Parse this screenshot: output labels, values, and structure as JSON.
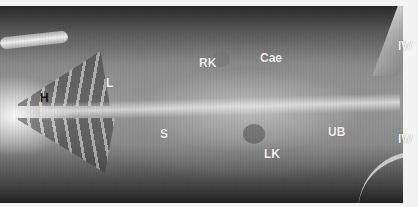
{
  "image": {
    "type": "radiograph",
    "description": "Ventrodorsal abdominal and thoracic x-ray",
    "labels": [
      {
        "id": "H",
        "text": "H",
        "x": 40,
        "y": 92,
        "dark": true
      },
      {
        "id": "L",
        "text": "L",
        "x": 106,
        "y": 77,
        "dark": false
      },
      {
        "id": "RK",
        "text": "RK",
        "x": 199,
        "y": 57,
        "dark": false
      },
      {
        "id": "Cae",
        "text": "Cae",
        "x": 260,
        "y": 52,
        "dark": false
      },
      {
        "id": "S",
        "text": "S",
        "x": 160,
        "y": 128,
        "dark": false
      },
      {
        "id": "UB",
        "text": "UB",
        "x": 328,
        "y": 126,
        "dark": false
      },
      {
        "id": "LK",
        "text": "LK",
        "x": 264,
        "y": 148,
        "dark": false
      },
      {
        "id": "IW1",
        "text": "IW",
        "x": 398,
        "y": 40,
        "dark": false
      },
      {
        "id": "IW2",
        "text": "IW",
        "x": 398,
        "y": 133,
        "dark": false
      }
    ]
  }
}
